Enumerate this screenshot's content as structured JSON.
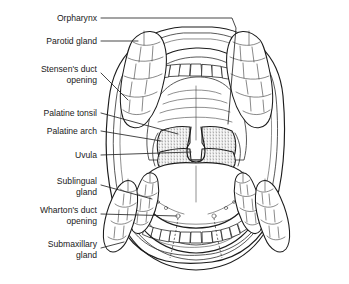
{
  "figure": {
    "background_color": "#ffffff",
    "ink_color": "#1c1c1c",
    "shading_color": "#6e6e6e"
  },
  "labels": [
    {
      "id": "orpharynx",
      "text": "Orpharynx",
      "line2": ""
    },
    {
      "id": "parotid-gland",
      "text": "Parotid gland",
      "line2": ""
    },
    {
      "id": "stensens-duct",
      "text": "Stensen's duct",
      "line2": "opening"
    },
    {
      "id": "palatine-tonsil",
      "text": "Palatine tonsil",
      "line2": ""
    },
    {
      "id": "palatine-arch",
      "text": "Palatine arch",
      "line2": ""
    },
    {
      "id": "uvula",
      "text": "Uvula",
      "line2": ""
    },
    {
      "id": "sublingual-gland",
      "text": "Sublingual",
      "line2": "gland"
    },
    {
      "id": "whartons-duct",
      "text": "Wharton's duct",
      "line2": "opening"
    },
    {
      "id": "submaxillary",
      "text": "Submaxillary",
      "line2": "gland"
    }
  ],
  "structures": {
    "upper_teeth_count": 14,
    "lower_teeth_count": 12,
    "glands": [
      "parotid-gland-left",
      "parotid-gland-right",
      "sublingual-gland-left",
      "sublingual-gland-right",
      "submaxillary-gland-left",
      "submaxillary-gland-right"
    ],
    "shaded_regions": [
      "palatine-tonsil-left",
      "palatine-tonsil-right",
      "soft-palate"
    ],
    "midline_features": [
      "uvula",
      "tongue-median-sulcus"
    ]
  }
}
